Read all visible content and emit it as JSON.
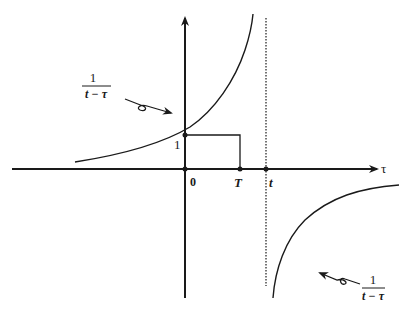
{
  "diagram": {
    "type": "function-plot",
    "function": "1/(t - τ)",
    "axes": {
      "horizontal_label": "τ",
      "origin_label": "0",
      "tick_labels": {
        "y_one": "1",
        "T": "T",
        "t": "t"
      }
    },
    "annotations": {
      "upper_left": {
        "numerator": "1",
        "denominator": "t − τ"
      },
      "lower_right": {
        "numerator": "1",
        "denominator": "t − τ"
      }
    },
    "elements": [
      "horizontal axis with arrow labeled τ",
      "vertical axis with arrow",
      "hyperbola branch left of asymptote (rising)",
      "hyperbola branch right of asymptote (below axis)",
      "dotted vertical asymptote at τ = t",
      "rectangle from 0 to T with height 1",
      "dots at origin, (0,1), T, t"
    ],
    "colors": {
      "ink": "#1a1a1a",
      "background": "#ffffff"
    }
  }
}
